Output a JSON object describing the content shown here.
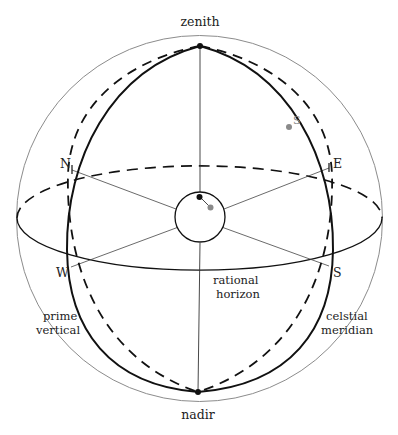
{
  "diagram": {
    "labels": {
      "zenith": "zenith",
      "nadir": "nadir",
      "north": "N",
      "east": "E",
      "west": "W",
      "south": "S",
      "sun": "S",
      "horizon_line1": "rational",
      "horizon_line2": "horizon",
      "prime_vertical_line1": "prime",
      "prime_vertical_line2": "vertical",
      "meridian_line1": "celstial",
      "meridian_line2": "meridian"
    },
    "colors": {
      "outline": "#888888",
      "ink": "#111111",
      "sun_marker": "#8a8a8a",
      "observer_marker": "#111111"
    }
  }
}
